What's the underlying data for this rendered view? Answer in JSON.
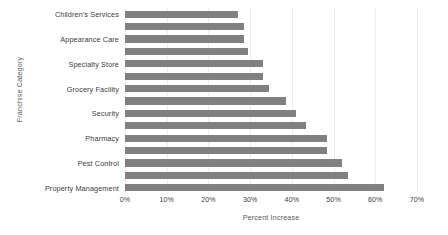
{
  "chart_data": {
    "type": "bar",
    "orientation": "horizontal",
    "title": "",
    "xlabel": "Percent Increase",
    "ylabel": "Franchise Category",
    "xlim": [
      0,
      70
    ],
    "xticks": [
      "0%",
      "10%",
      "20%",
      "30%",
      "40%",
      "50%",
      "60%",
      "70%"
    ],
    "xtick_values": [
      0,
      10,
      20,
      30,
      40,
      50,
      60,
      70
    ],
    "grid": "vertical",
    "legend": "none",
    "bar_color": "#808080",
    "categories": [
      "Children's Services",
      "",
      "Appearance Care",
      "",
      "Specialty Store",
      "",
      "Grocery Facility",
      "",
      "Security",
      "",
      "Pharmacy",
      "",
      "Pest Control",
      "",
      "Property Management"
    ],
    "labeled_categories": [
      "Children's Services",
      "Appearance Care",
      "Specialty Store",
      "Grocery Facility",
      "Security",
      "Pharmacy",
      "Pest Control",
      "Property Management"
    ],
    "values": [
      27,
      28.5,
      28.5,
      29.5,
      33,
      33,
      34.5,
      38.5,
      41,
      43.5,
      48.5,
      48.5,
      52,
      53.5,
      62
    ]
  }
}
